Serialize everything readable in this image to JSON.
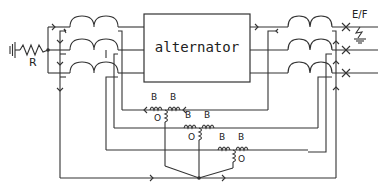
{
  "diagram": {
    "type": "circuit-schematic",
    "alternator_label": "alternator",
    "resistor_label": "R",
    "earth_fault_label": "E/F",
    "bias_coil_label": "B",
    "operating_coil_label": "O",
    "relays": [
      {
        "id": "relay-1",
        "bias_left": "B",
        "bias_right": "B",
        "operating": "O"
      },
      {
        "id": "relay-2",
        "bias_left": "B",
        "bias_right": "B",
        "operating": "O"
      },
      {
        "id": "relay-3",
        "bias_left": "B",
        "bias_right": "B",
        "operating": "O"
      }
    ],
    "phases": 3,
    "line_colors": {
      "wire": "#333333",
      "background": "#ffffff"
    }
  }
}
